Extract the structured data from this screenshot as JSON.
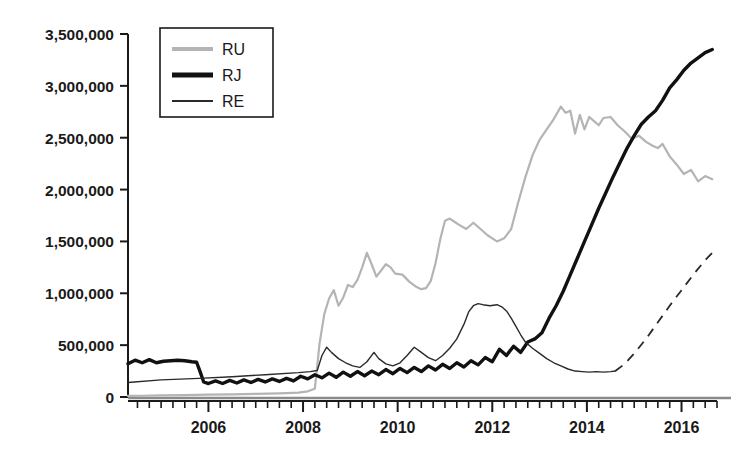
{
  "chart_data": {
    "type": "line",
    "title": "",
    "xlabel": "",
    "ylabel": "",
    "xlim": [
      2004.3,
      2016.75
    ],
    "ylim": [
      0,
      3500000
    ],
    "grid": false,
    "legend_position": "top-left",
    "y_ticks": [
      0,
      500000,
      1000000,
      1500000,
      2000000,
      2500000,
      3000000,
      3500000
    ],
    "y_tick_labels": [
      "0",
      "500,000",
      "1,000,000",
      "1,500,000",
      "2,000,000",
      "2,500,000",
      "3,000,000",
      "3,500,000"
    ],
    "x_ticks": [
      2006,
      2008,
      2010,
      2012,
      2014,
      2016
    ],
    "x_tick_labels": [
      "2006",
      "2008",
      "2010",
      "2012",
      "2014",
      "2016"
    ],
    "x_minor_tick_interval": 0.25,
    "series": [
      {
        "name": "RU",
        "color": "#b4b4b4",
        "width": 2.2,
        "style": "solid",
        "x": [
          2004.3,
          2004.6,
          2005.0,
          2005.5,
          2006.0,
          2006.5,
          2007.0,
          2007.5,
          2007.9,
          2008.1,
          2008.25,
          2008.35,
          2008.45,
          2008.55,
          2008.65,
          2008.75,
          2008.85,
          2008.95,
          2009.05,
          2009.15,
          2009.25,
          2009.35,
          2009.45,
          2009.55,
          2009.65,
          2009.75,
          2009.85,
          2009.95,
          2010.1,
          2010.25,
          2010.4,
          2010.5,
          2010.6,
          2010.7,
          2010.8,
          2010.9,
          2011.0,
          2011.1,
          2011.2,
          2011.3,
          2011.45,
          2011.6,
          2011.75,
          2011.9,
          2012.0,
          2012.1,
          2012.25,
          2012.4,
          2012.55,
          2012.7,
          2012.85,
          2013.0,
          2013.15,
          2013.3,
          2013.45,
          2013.55,
          2013.65,
          2013.75,
          2013.85,
          2013.95,
          2014.05,
          2014.15,
          2014.25,
          2014.35,
          2014.5,
          2014.65,
          2014.8,
          2014.95,
          2015.1,
          2015.25,
          2015.4,
          2015.5,
          2015.6,
          2015.75,
          2015.9,
          2016.05,
          2016.2,
          2016.35,
          2016.5,
          2016.65
        ],
        "y": [
          10000,
          12000,
          15000,
          18000,
          22000,
          26000,
          30000,
          35000,
          42000,
          55000,
          80000,
          520000,
          800000,
          950000,
          1030000,
          880000,
          960000,
          1080000,
          1060000,
          1130000,
          1250000,
          1390000,
          1280000,
          1160000,
          1220000,
          1280000,
          1250000,
          1190000,
          1180000,
          1110000,
          1060000,
          1040000,
          1050000,
          1120000,
          1290000,
          1520000,
          1700000,
          1720000,
          1690000,
          1660000,
          1620000,
          1680000,
          1620000,
          1560000,
          1530000,
          1500000,
          1530000,
          1620000,
          1880000,
          2120000,
          2330000,
          2480000,
          2580000,
          2680000,
          2800000,
          2740000,
          2760000,
          2540000,
          2720000,
          2580000,
          2700000,
          2660000,
          2620000,
          2690000,
          2700000,
          2620000,
          2560000,
          2490000,
          2520000,
          2460000,
          2420000,
          2400000,
          2440000,
          2320000,
          2240000,
          2150000,
          2190000,
          2080000,
          2130000,
          2100000
        ]
      },
      {
        "name": "RJ",
        "color": "#111111",
        "width": 3.4,
        "style": "solid",
        "x": [
          2004.3,
          2004.45,
          2004.6,
          2004.75,
          2004.9,
          2005.05,
          2005.2,
          2005.35,
          2005.5,
          2005.65,
          2005.75,
          2005.82,
          2005.9,
          2006.0,
          2006.15,
          2006.3,
          2006.45,
          2006.6,
          2006.75,
          2006.9,
          2007.05,
          2007.2,
          2007.35,
          2007.5,
          2007.65,
          2007.8,
          2007.95,
          2008.1,
          2008.25,
          2008.4,
          2008.55,
          2008.7,
          2008.85,
          2009.0,
          2009.15,
          2009.3,
          2009.45,
          2009.6,
          2009.75,
          2009.9,
          2010.05,
          2010.2,
          2010.35,
          2010.5,
          2010.65,
          2010.8,
          2010.95,
          2011.1,
          2011.25,
          2011.4,
          2011.55,
          2011.7,
          2011.85,
          2012.0,
          2012.15,
          2012.3,
          2012.45,
          2012.6,
          2012.75,
          2012.9,
          2013.05,
          2013.2,
          2013.35,
          2013.5,
          2013.65,
          2013.8,
          2013.95,
          2014.1,
          2014.25,
          2014.4,
          2014.55,
          2014.7,
          2014.85,
          2015.0,
          2015.15,
          2015.3,
          2015.45,
          2015.6,
          2015.75,
          2015.9,
          2016.05,
          2016.2,
          2016.35,
          2016.5,
          2016.65
        ],
        "y": [
          320000,
          355000,
          330000,
          360000,
          330000,
          345000,
          350000,
          355000,
          350000,
          340000,
          335000,
          250000,
          145000,
          130000,
          155000,
          130000,
          160000,
          135000,
          165000,
          140000,
          170000,
          145000,
          175000,
          150000,
          180000,
          155000,
          200000,
          175000,
          215000,
          185000,
          230000,
          190000,
          240000,
          200000,
          245000,
          205000,
          250000,
          215000,
          265000,
          225000,
          275000,
          235000,
          285000,
          245000,
          300000,
          260000,
          315000,
          275000,
          330000,
          290000,
          350000,
          310000,
          380000,
          340000,
          460000,
          400000,
          490000,
          430000,
          530000,
          560000,
          620000,
          760000,
          880000,
          1020000,
          1180000,
          1340000,
          1500000,
          1660000,
          1820000,
          1970000,
          2120000,
          2260000,
          2400000,
          2520000,
          2630000,
          2700000,
          2760000,
          2860000,
          2980000,
          3060000,
          3150000,
          3220000,
          3270000,
          3320000,
          3350000
        ]
      },
      {
        "name": "RE",
        "color": "#2a2a2a",
        "width": 1.4,
        "style": "solid-then-dashed",
        "dash_start_x": 2014.6,
        "x": [
          2004.3,
          2005.0,
          2005.8,
          2006.5,
          2007.2,
          2007.9,
          2008.15,
          2008.3,
          2008.4,
          2008.5,
          2008.6,
          2008.75,
          2008.9,
          2009.05,
          2009.2,
          2009.35,
          2009.5,
          2009.6,
          2009.75,
          2009.9,
          2010.05,
          2010.2,
          2010.35,
          2010.5,
          2010.65,
          2010.8,
          2010.95,
          2011.1,
          2011.25,
          2011.4,
          2011.5,
          2011.6,
          2011.7,
          2011.8,
          2011.95,
          2012.1,
          2012.2,
          2012.3,
          2012.4,
          2012.5,
          2012.6,
          2012.7,
          2012.85,
          2013.0,
          2013.15,
          2013.3,
          2013.45,
          2013.6,
          2013.75,
          2013.9,
          2014.05,
          2014.2,
          2014.35,
          2014.5,
          2014.6,
          2014.8,
          2015.0,
          2015.25,
          2015.5,
          2015.75,
          2016.0,
          2016.25,
          2016.5,
          2016.65
        ],
        "y": [
          140000,
          165000,
          180000,
          195000,
          215000,
          235000,
          245000,
          255000,
          400000,
          480000,
          430000,
          370000,
          330000,
          300000,
          285000,
          340000,
          430000,
          370000,
          320000,
          300000,
          330000,
          400000,
          480000,
          430000,
          380000,
          350000,
          400000,
          470000,
          560000,
          700000,
          820000,
          880000,
          900000,
          890000,
          880000,
          890000,
          870000,
          830000,
          760000,
          680000,
          600000,
          530000,
          470000,
          420000,
          370000,
          330000,
          300000,
          270000,
          250000,
          245000,
          240000,
          245000,
          240000,
          245000,
          250000,
          320000,
          420000,
          560000,
          720000,
          880000,
          1030000,
          1180000,
          1320000,
          1390000
        ]
      }
    ],
    "legend": [
      {
        "label": "RU",
        "color": "#b4b4b4",
        "width": 4,
        "style": "solid"
      },
      {
        "label": "RJ",
        "color": "#111111",
        "width": 5,
        "style": "solid"
      },
      {
        "label": "RE",
        "color": "#2a2a2a",
        "width": 2,
        "style": "solid"
      }
    ]
  },
  "axes": {
    "axis_color": "#1a1a1a",
    "baseline_color": "#8a8a8a"
  }
}
